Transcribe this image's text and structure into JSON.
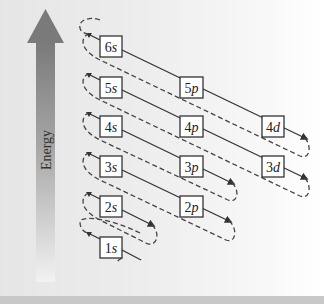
{
  "axis": {
    "label": "Energy",
    "arrow_color": "#7a7a7a"
  },
  "orbitals": [
    {
      "name": "1s",
      "n": "1",
      "l": "s",
      "x": 100,
      "y": 237
    },
    {
      "name": "2s",
      "n": "2",
      "l": "s",
      "x": 100,
      "y": 196
    },
    {
      "name": "2p",
      "n": "2",
      "l": "p",
      "x": 180,
      "y": 196
    },
    {
      "name": "3s",
      "n": "3",
      "l": "s",
      "x": 100,
      "y": 156
    },
    {
      "name": "3p",
      "n": "3",
      "l": "p",
      "x": 180,
      "y": 156
    },
    {
      "name": "3d",
      "n": "3",
      "l": "d",
      "x": 262,
      "y": 156
    },
    {
      "name": "4s",
      "n": "4",
      "l": "s",
      "x": 100,
      "y": 116
    },
    {
      "name": "4p",
      "n": "4",
      "l": "p",
      "x": 180,
      "y": 116
    },
    {
      "name": "4d",
      "n": "4",
      "l": "d",
      "x": 262,
      "y": 116
    },
    {
      "name": "5s",
      "n": "5",
      "l": "s",
      "x": 100,
      "y": 77
    },
    {
      "name": "5p",
      "n": "5",
      "l": "p",
      "x": 180,
      "y": 77
    },
    {
      "name": "6s",
      "n": "6",
      "l": "s",
      "x": 100,
      "y": 36
    }
  ],
  "filling_order": [
    "1s",
    "2s",
    "2p",
    "3s",
    "3p",
    "4s",
    "3d",
    "4p",
    "5s",
    "4d",
    "5p",
    "6s"
  ],
  "colors": {
    "box_border": "#333333",
    "box_fill": "#ffffff",
    "line": "#333333",
    "dashed": "#444444"
  }
}
